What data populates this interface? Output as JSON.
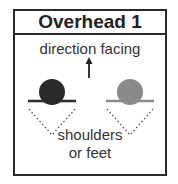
{
  "title": "Overhead 1",
  "direction_label": "direction facing",
  "bottom_label_line1": "shoulders",
  "bottom_label_line2": "or feet",
  "figures": [
    {
      "name": "person-left",
      "color": "#2b2b2b"
    },
    {
      "name": "person-right",
      "color": "#8a8a8a"
    }
  ],
  "colors": {
    "border": "#2a2a2a",
    "text": "#333333"
  }
}
